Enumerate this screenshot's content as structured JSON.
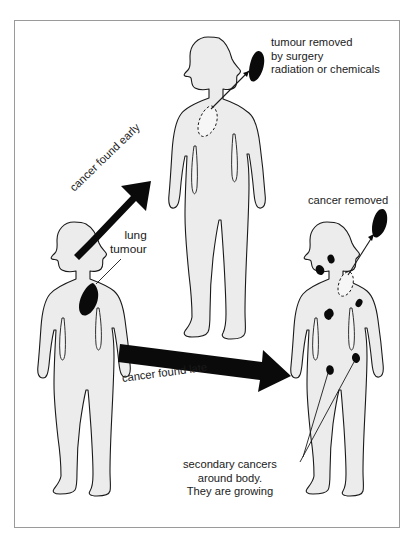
{
  "diagram": {
    "frame": {
      "border_color": "#9a9a9a"
    },
    "colors": {
      "body_fill": "#ececec",
      "outline": "#1a1a1a",
      "tumour": "#0a0a0a",
      "background": "#ffffff"
    },
    "labels": {
      "tumour_removed": "tumour removed\nby surgery\nradiation or chemicals",
      "cancer_removed": "cancer removed",
      "lung_tumour": "lung\ntumour",
      "cancer_found_early": "cancer found early",
      "cancer_found_late": "cancer found late",
      "secondary_cancers": "secondary cancers\naround body.\nThey are growing"
    },
    "figures": [
      {
        "id": "patient-initial",
        "position": "left",
        "description": "person with a single lung tumour",
        "tumour_count": 1,
        "tumour_type": "primary"
      },
      {
        "id": "patient-early-treated",
        "position": "top-middle",
        "description": "person whose tumour was removed after early detection",
        "tumour_count": 0,
        "tumour_type": "removed"
      },
      {
        "id": "patient-late-treated",
        "position": "bottom-right",
        "description": "person with secondary cancers spread around the body after late detection",
        "tumour_count": 7,
        "tumour_type": "secondary"
      }
    ],
    "arrows": [
      {
        "id": "arrow-early",
        "label": "cancer found early",
        "direction": "up-right"
      },
      {
        "id": "arrow-late",
        "label": "cancer found late",
        "direction": "right"
      }
    ]
  }
}
